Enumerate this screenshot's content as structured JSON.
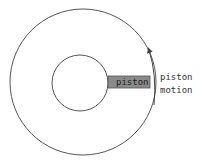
{
  "diagram": {
    "piston_label": "piston",
    "motion_label_line1": "piston",
    "motion_label_line2": "motion",
    "colors": {
      "stroke": "#555555",
      "piston_fill": "#8a8a8a",
      "background": "#ffffff"
    }
  }
}
